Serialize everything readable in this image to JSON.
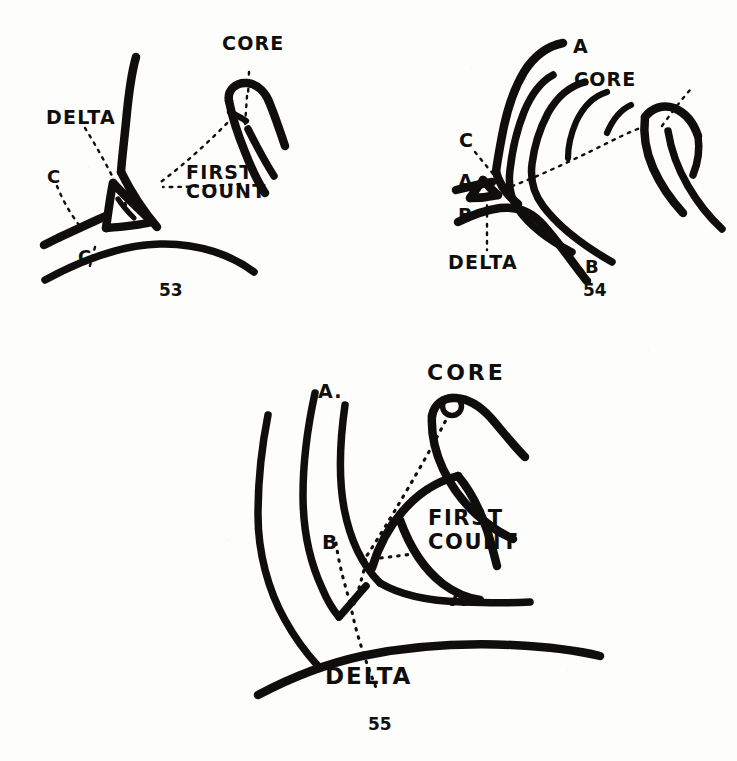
{
  "page": {
    "kind": "fingerprint-ridge-counting-plate",
    "background_color": "#fdfdfb",
    "ink_color": "#100e0c"
  },
  "figures": [
    {
      "id": "fig-53",
      "number": "53",
      "labels": {
        "core": "CORE",
        "delta": "DELTA",
        "first_count_line1": "FIRST",
        "first_count_line2": "COUNT",
        "ridge_c_upper": "C",
        "ridge_c_lower": "C"
      }
    },
    {
      "id": "fig-54",
      "number": "54",
      "labels": {
        "core": "CORE",
        "delta": "DELTA",
        "ridge_a_top": "A",
        "ridge_a_left": "A",
        "ridge_b_left": "B",
        "ridge_b_right": "B",
        "ridge_c": "C"
      }
    },
    {
      "id": "fig-55",
      "number": "55",
      "labels": {
        "core": "CORE",
        "delta": "DELTA",
        "first_count_line1": "FIRST",
        "first_count_line2": "COUNT",
        "ridge_a_top": "A.",
        "ridge_a_right": "A",
        "ridge_b": "B"
      }
    }
  ],
  "style": {
    "label_font_size_large": "19px",
    "label_font_size_medium": "17px",
    "label_font_size_small": "16px",
    "ridge_stroke_width": 7,
    "leader_dash": "2 6"
  }
}
